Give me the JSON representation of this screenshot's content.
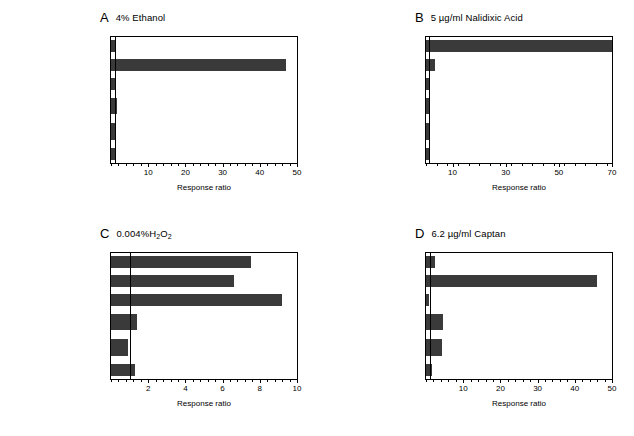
{
  "figure": {
    "xlabel": "Response ratio",
    "caption": ""
  },
  "categories": [
    {
      "gene": "recA",
      "desc": " SOS",
      "lines": 1
    },
    {
      "gene": "grpE",
      "desc": " Heat Shock",
      "lines": 1
    },
    {
      "gene": "katG",
      "desc": " OxyR",
      "lines": 1
    },
    {
      "gene": "inaA",
      "desc": " Superoxide<br>or Multiple Antibiotic",
      "lines": 2
    },
    {
      "gene": "yciG",
      "desc": " σ<sup>S</sup>-Dependent<br>Stress Response",
      "lines": 2
    },
    {
      "gene": "o513",
      "desc": " ?",
      "lines": 1
    }
  ],
  "chart_data": [
    {
      "type": "bar",
      "panel": "A",
      "title": "4% Ethanol",
      "orientation": "horizontal",
      "categories": [
        "recA/ SOS",
        "grpE/ Heat Shock",
        "katG/ OxyR",
        "inaA/ Superoxide or Multiple Antibiotic",
        "yciG/ σS-Dependent Stress Response",
        "o513/ ?"
      ],
      "values": [
        1.0,
        47.0,
        1.0,
        1.5,
        1.0,
        1.0
      ],
      "xlabel": "Response ratio",
      "ylabel": "",
      "xlim": [
        0,
        50
      ],
      "xticks": [
        10,
        20,
        30,
        40,
        50
      ],
      "refline": 1,
      "grid": false
    },
    {
      "type": "bar",
      "panel": "B",
      "title": "5 µg/ml Nalidixic Acid",
      "orientation": "horizontal",
      "categories": [
        "recA/ SOS",
        "grpE/ Heat Shock",
        "katG/ OxyR",
        "inaA/ Superoxide or Multiple Antibiotic",
        "yciG/ σS-Dependent Stress Response",
        "o513/ ?"
      ],
      "values": [
        70.0,
        3.2,
        1.0,
        1.6,
        1.4,
        1.0
      ],
      "xlabel": "Response ratio",
      "ylabel": "",
      "xlim": [
        0,
        70
      ],
      "xticks": [
        10,
        30,
        50,
        70
      ],
      "refline": 1,
      "grid": false
    },
    {
      "type": "bar",
      "panel": "C",
      "title": "0.004%H<sub>2</sub>O<sub>2</sub>",
      "orientation": "horizontal",
      "categories": [
        "recA/ SOS",
        "grpE/ Heat Shock",
        "katG/ OxyR",
        "inaA/ Superoxide or Multiple Antibiotic",
        "yciG/ σS-Dependent Stress Response",
        "o513/ ?"
      ],
      "values": [
        7.5,
        6.6,
        9.2,
        1.4,
        0.9,
        1.3
      ],
      "xlabel": "Response ratio",
      "ylabel": "",
      "xlim": [
        0,
        10
      ],
      "xticks": [
        2,
        4,
        6,
        8,
        10
      ],
      "refline": 1,
      "grid": false
    },
    {
      "type": "bar",
      "panel": "D",
      "title": "6.2 µg/ml Captan",
      "orientation": "horizontal",
      "categories": [
        "recA/ SOS",
        "grpE/ Heat Shock",
        "katG/ OxyR",
        "inaA/ Superoxide or Multiple Antibiotic",
        "yciG/ σS-Dependent Stress Response",
        "o513/ ?"
      ],
      "values": [
        2.3,
        46.0,
        0.7,
        4.5,
        4.3,
        1.6
      ],
      "xlabel": "Response ratio",
      "ylabel": "",
      "xlim": [
        0,
        50
      ],
      "xticks": [
        10,
        20,
        30,
        40,
        50
      ],
      "refline": 1,
      "grid": false
    }
  ]
}
